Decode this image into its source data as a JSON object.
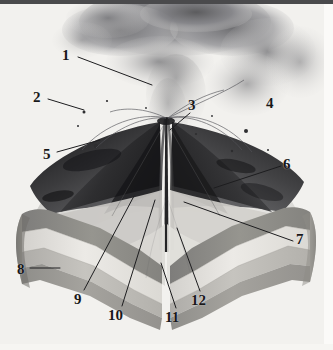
{
  "figure": {
    "kind": "labeled-anatomy-illustration",
    "width": 333,
    "height": 350,
    "background_color": "#f2f1ee",
    "top_bar_color": "#4a4a4c",
    "render_style": "grayscale photographic 3-D cutaway render"
  },
  "scene": {
    "ash_plume": {
      "name": "eruption-ash-cloud",
      "color_dark": "#6c6c6e",
      "color_mid": "#9b9b9d",
      "color_light": "#c9c8c6"
    },
    "cone": {
      "name": "volcanic-cone",
      "surface_light": "#d6d5d2",
      "surface_mid": "#b4b3b0",
      "interior_dark": "#3a3a3c",
      "interior_darkest": "#1e1e20"
    },
    "strata": [
      {
        "name": "upper-volcanic-pile",
        "color": "#8d8c8a"
      },
      {
        "name": "pale-sediment-band",
        "color": "#dedcd8"
      },
      {
        "name": "mid-gray-band",
        "color": "#b8b6b2"
      },
      {
        "name": "lower-basement-band",
        "color": "#9a9895"
      }
    ],
    "conduit": {
      "name": "central-conduit",
      "color": "#2a2a2c"
    }
  },
  "labels": [
    {
      "id": "1",
      "text": "1",
      "x": 62,
      "y": 48,
      "anchor": "left"
    },
    {
      "id": "2",
      "text": "2",
      "x": 33,
      "y": 90,
      "anchor": "left"
    },
    {
      "id": "3",
      "text": "3",
      "x": 188,
      "y": 98,
      "anchor": "left"
    },
    {
      "id": "4",
      "text": "4",
      "x": 266,
      "y": 96,
      "anchor": "left"
    },
    {
      "id": "5",
      "text": "5",
      "x": 43,
      "y": 147,
      "anchor": "left"
    },
    {
      "id": "6",
      "text": "6",
      "x": 283,
      "y": 157,
      "anchor": "left"
    },
    {
      "id": "7",
      "text": "7",
      "x": 296,
      "y": 232,
      "anchor": "left"
    },
    {
      "id": "8",
      "text": "8",
      "x": 17,
      "y": 262,
      "anchor": "left"
    },
    {
      "id": "9",
      "text": "9",
      "x": 74,
      "y": 292,
      "anchor": "left"
    },
    {
      "id": "10",
      "text": "10",
      "x": 108,
      "y": 308,
      "anchor": "left"
    },
    {
      "id": "11",
      "text": "11",
      "x": 165,
      "y": 310,
      "anchor": "left"
    },
    {
      "id": "12",
      "text": "12",
      "x": 191,
      "y": 293,
      "anchor": "left"
    }
  ],
  "leader_lines": [
    {
      "for": "1",
      "from": [
        78,
        57
      ],
      "to": [
        152,
        85
      ]
    },
    {
      "for": "2",
      "from": [
        48,
        99
      ],
      "to": [
        84,
        110
      ]
    },
    {
      "for": "3",
      "from": [
        190,
        113
      ],
      "to": [
        170,
        130
      ]
    },
    {
      "for": "5",
      "from": [
        57,
        152
      ],
      "to": [
        100,
        140
      ]
    },
    {
      "for": "6",
      "from": [
        281,
        166
      ],
      "to": [
        214,
        188
      ]
    },
    {
      "for": "7",
      "from": [
        293,
        241
      ],
      "to": [
        184,
        202
      ]
    },
    {
      "for": "8",
      "from": [
        30,
        268
      ],
      "to": [
        60,
        268
      ]
    },
    {
      "for": "9",
      "from": [
        84,
        290
      ],
      "to": [
        134,
        196
      ]
    },
    {
      "for": "10",
      "from": [
        122,
        306
      ],
      "to": [
        155,
        200
      ]
    },
    {
      "for": "11",
      "from": [
        176,
        308
      ],
      "to": [
        161,
        263
      ]
    },
    {
      "for": "12",
      "from": [
        200,
        291
      ],
      "to": [
        177,
        228
      ]
    }
  ]
}
